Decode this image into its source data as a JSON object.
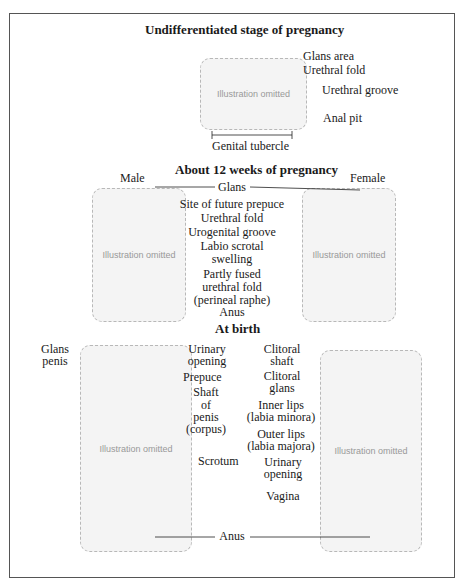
{
  "sections": {
    "undifferentiated": {
      "title": "Undifferentiated stage of pregnancy",
      "labels": [
        "Glans area",
        "Urethral fold",
        "Urethral groove",
        "Anal pit"
      ],
      "bracket_label": "Genital tubercle",
      "placeholder": "Illustration omitted"
    },
    "twelve_weeks": {
      "title": "About 12 weeks of pregnancy",
      "male_heading": "Male",
      "female_heading": "Female",
      "labels": [
        "Glans",
        "Site of future prepuce",
        "Urethral fold",
        "Urogenital groove",
        "Labio scrotal",
        "swelling",
        "Partly fused",
        "urethral fold",
        "(perineal raphe)",
        "Anus"
      ],
      "placeholder": "Illustration omitted"
    },
    "at_birth": {
      "title": "At birth",
      "male_labels": [
        "Glans",
        "penis",
        "Urinary",
        "opening",
        "Prepuce",
        "Shaft",
        "of",
        "penis",
        "(corpus)",
        "Scrotum"
      ],
      "female_labels": [
        "Clitoral",
        "shaft",
        "Clitoral",
        "glans",
        "Inner lips",
        "(labia minora)",
        "Outer lips",
        "(labia majora)",
        "Urinary",
        "opening",
        "Vagina"
      ],
      "shared_label": "Anus",
      "placeholder": "Illustration omitted"
    }
  }
}
